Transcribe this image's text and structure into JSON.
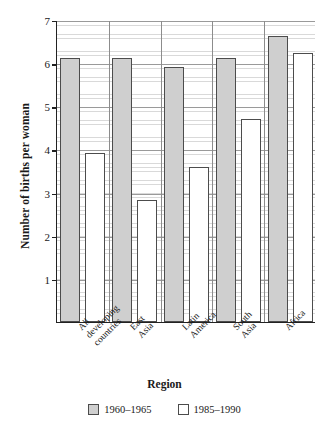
{
  "chart_data": {
    "type": "bar",
    "title": "",
    "xlabel": "Region",
    "ylabel": "Number of births per woman",
    "categories": [
      "All\ndeveloping\ncountries",
      "East\nAsia",
      "Latin\nAmerica",
      "South\nAsia",
      "Africa"
    ],
    "series": [
      {
        "name": "1960–1965",
        "color": "#cfcfcf",
        "values": [
          6.12,
          6.12,
          5.92,
          6.13,
          6.64
        ]
      },
      {
        "name": "1985–1990",
        "color": "#ffffff",
        "values": [
          3.92,
          2.83,
          3.6,
          4.71,
          6.24
        ]
      }
    ],
    "ylim": [
      0,
      7
    ],
    "yticks": [
      1,
      2,
      3,
      4,
      5,
      6,
      7
    ],
    "ytick_labels": [
      "1",
      "2",
      "3",
      "4",
      "5",
      "6",
      "7"
    ],
    "grid": "horizontal-hairlines",
    "legend_position": "bottom-center"
  },
  "axes": {
    "y_title": "Number of births per woman",
    "x_title": "Region"
  },
  "legend": {
    "items": [
      {
        "label": "1960–1965",
        "swatch": "gray-swatch"
      },
      {
        "label": "1985–1990",
        "swatch": "white-swatch"
      }
    ]
  }
}
